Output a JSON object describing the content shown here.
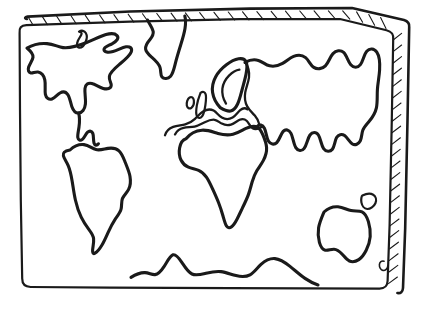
{
  "document": {
    "title": "World Map",
    "kind": "hand-drawn line-art coloring page",
    "caption": "",
    "background_color": "#ffffff",
    "ink_color": "#1a1a1a"
  },
  "frame": {
    "name": "map-border-slab",
    "style": "hand-drawn rectangle with 3D slab edge",
    "hatching": {
      "top_edge_marks": 26,
      "right_edge_marks": 22,
      "description": "diagonal hatch strokes suggesting thickness"
    }
  },
  "landmasses": [
    {
      "id": "north-america",
      "label": "North America"
    },
    {
      "id": "greenland",
      "label": "Greenland"
    },
    {
      "id": "baffin-island",
      "label": "Baffin Island"
    },
    {
      "id": "south-america",
      "label": "South America"
    },
    {
      "id": "africa",
      "label": "Africa"
    },
    {
      "id": "europe-asia",
      "label": "Eurasia"
    },
    {
      "id": "scandinavia-inlet",
      "label": "Scandinavia"
    },
    {
      "id": "great-britain",
      "label": "Great Britain"
    },
    {
      "id": "ireland",
      "label": "Ireland"
    },
    {
      "id": "australia",
      "label": "Australia"
    },
    {
      "id": "new-guinea",
      "label": "New Guinea"
    },
    {
      "id": "new-zealand",
      "label": "New Zealand"
    },
    {
      "id": "antarctica",
      "label": "Antarctica"
    }
  ],
  "labels": {
    "visible_text": [],
    "note": "no textual labels are printed on the map"
  }
}
